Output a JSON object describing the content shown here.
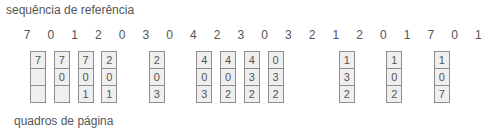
{
  "title": "sequência de referência",
  "footer": "quadros de página",
  "reference_string": [
    "7",
    "0",
    "1",
    "2",
    "0",
    "3",
    "0",
    "4",
    "2",
    "3",
    "0",
    "3",
    "2",
    "1",
    "2",
    "0",
    "1",
    "7",
    "0",
    "1"
  ],
  "frames": [
    {
      "index": 0,
      "cells": [
        "7",
        "",
        ""
      ]
    },
    {
      "index": 1,
      "cells": [
        "7",
        "0",
        ""
      ]
    },
    {
      "index": 2,
      "cells": [
        "7",
        "0",
        "1"
      ]
    },
    {
      "index": 3,
      "cells": [
        "2",
        "0",
        "1"
      ]
    },
    {
      "index": 5,
      "cells": [
        "2",
        "0",
        "3"
      ]
    },
    {
      "index": 7,
      "cells": [
        "4",
        "0",
        "3"
      ]
    },
    {
      "index": 8,
      "cells": [
        "4",
        "0",
        "2"
      ]
    },
    {
      "index": 9,
      "cells": [
        "4",
        "3",
        "2"
      ]
    },
    {
      "index": 10,
      "cells": [
        "0",
        "3",
        "2"
      ]
    },
    {
      "index": 13,
      "cells": [
        "1",
        "3",
        "2"
      ]
    },
    {
      "index": 15,
      "cells": [
        "1",
        "0",
        "2"
      ]
    },
    {
      "index": 17,
      "cells": [
        "1",
        "0",
        "7"
      ]
    }
  ],
  "colors": {
    "frame_fill": "#efefef",
    "frame_border": "#8e8e8e",
    "text": "#555555"
  }
}
